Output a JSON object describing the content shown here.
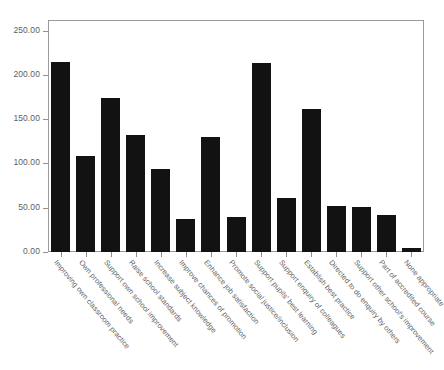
{
  "chart_data": {
    "type": "bar",
    "title": "",
    "subtitle": "",
    "xlabel": "",
    "ylabel": "",
    "ylim": [
      0,
      262
    ],
    "grid": false,
    "legend": "none",
    "bar_color": "#121212",
    "axis_color": "#8f8f8f",
    "label_color": "#5e5e5e",
    "y_ticks": [
      "0.00",
      "50.00",
      "100.00",
      "150.00",
      "200.00",
      "250.00"
    ],
    "y_tick_values": [
      0,
      50,
      100,
      150,
      200,
      250
    ],
    "categories": [
      "Improving own classroom practice",
      "Own professional needs",
      "Support own school improvement",
      "Raise school standards",
      "Increase subject knowledge",
      "Improve chances of promotion",
      "Enhance job satisfaction",
      "Promote social justice/inclusion",
      "Support pupils' best learning",
      "Support enquiry of colleagues",
      "Establish best practice",
      "Directed to do enquiry by others",
      "Support other school's improvement",
      "Part of accredited course",
      "None appropriate"
    ],
    "values": [
      215,
      108,
      174,
      132,
      94,
      37,
      130,
      40,
      213,
      61,
      161,
      52,
      51,
      42,
      4
    ]
  }
}
